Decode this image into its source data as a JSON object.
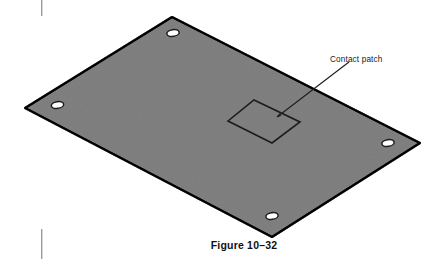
{
  "figure": {
    "caption": "Figure 10–32",
    "callout_label": "Contact patch",
    "object_name": "rectangular plate isometric view",
    "colors": {
      "plate_fill": "#b4b4b4",
      "plate_outline": "#1c1c1c",
      "hole_fill": "#ffffff",
      "hole_outline": "#1c1c1c",
      "patch_outline": "#1c1c1c",
      "leader_line": "#1c1c1c",
      "text": "#111111",
      "background": "#ffffff",
      "margin_mark": "#8c8c8c"
    },
    "geometry": {
      "plate_vertices": [
        [
          172,
          17
        ],
        [
          420,
          143
        ],
        [
          272,
          237
        ],
        [
          25,
          108
        ]
      ],
      "holes": [
        {
          "name": "hole-top",
          "cx": 173,
          "cy": 33,
          "rx": 6.2,
          "ry": 3.4,
          "rotate": -8
        },
        {
          "name": "hole-left",
          "cx": 57.5,
          "cy": 105,
          "rx": 6.2,
          "ry": 3.4,
          "rotate": -8
        },
        {
          "name": "hole-right",
          "cx": 388,
          "cy": 143,
          "rx": 6.2,
          "ry": 3.4,
          "rotate": -8
        },
        {
          "name": "hole-bottom",
          "cx": 272,
          "cy": 216,
          "rx": 6.2,
          "ry": 3.4,
          "rotate": -8
        }
      ],
      "contact_patch_vertices": [
        [
          254,
          100
        ],
        [
          300,
          122
        ],
        [
          272,
          143
        ],
        [
          228,
          121
        ]
      ],
      "leader_line": {
        "from": [
          349,
          62
        ],
        "to": [
          276,
          118
        ]
      },
      "callout_text_position": [
        330,
        62
      ],
      "caption_position": [
        244,
        248
      ]
    },
    "margin_marks": [
      {
        "name": "margin-mark-top",
        "x": 41,
        "y": 0,
        "width": 1.4,
        "height": 16
      },
      {
        "name": "margin-mark-bottom",
        "x": 41,
        "y": 229,
        "width": 1.4,
        "height": 30
      }
    ]
  }
}
